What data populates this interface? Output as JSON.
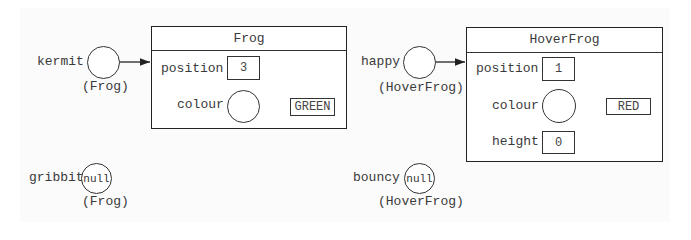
{
  "diagram": {
    "references": [
      {
        "name": "kermit",
        "type_label": "(Frog)",
        "value": "",
        "points_to": "Frog"
      },
      {
        "name": "gribbit",
        "type_label": "(Frog)",
        "value": "null"
      },
      {
        "name": "happy",
        "type_label": "(HoverFrog)",
        "value": "",
        "points_to": "HoverFrog"
      },
      {
        "name": "bouncy",
        "type_label": "(HoverFrog)",
        "value": "null"
      }
    ],
    "objects": [
      {
        "class_name": "Frog",
        "fields": [
          {
            "name": "position",
            "value": "3"
          },
          {
            "name": "colour",
            "ref_value": "GREEN"
          }
        ]
      },
      {
        "class_name": "HoverFrog",
        "fields": [
          {
            "name": "position",
            "value": "1"
          },
          {
            "name": "colour",
            "ref_value": "RED"
          },
          {
            "name": "height",
            "value": "0"
          }
        ]
      }
    ],
    "colors": {
      "line": "#222222",
      "text": "#3a3a3a",
      "background": "#ffffff"
    }
  }
}
